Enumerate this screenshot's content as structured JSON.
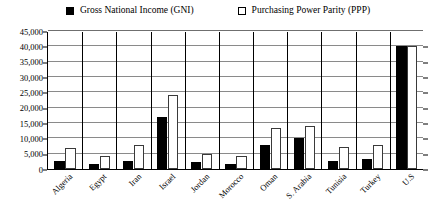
{
  "legend": {
    "position": "top-center",
    "entries": [
      {
        "label": "Gross National Income (GNI)",
        "marker": "filled-square",
        "color": "#000000"
      },
      {
        "label": "Purchasing Power Parity (PPP)",
        "marker": "hollow-square",
        "color": "#ffffff"
      }
    ]
  },
  "chart_data": {
    "type": "bar",
    "title": "",
    "subtitle": "",
    "xlabel": "",
    "ylabel": "",
    "ylim": [
      0,
      45000
    ],
    "ytick_step": 5000,
    "ytick_labels": [
      "0",
      "5,000",
      "10,000",
      "15,000",
      "20,000",
      "25,000",
      "30,000",
      "35,000",
      "40,000",
      "45,000"
    ],
    "ytick_values": [
      0,
      5000,
      10000,
      15000,
      20000,
      25000,
      30000,
      35000,
      40000,
      45000
    ],
    "grid": true,
    "grid_axis": "y",
    "legend_position": "top-center",
    "categories": [
      "Algeria",
      "Egypt",
      "Iran",
      "Israel",
      "Jordan",
      "Morocco",
      "Oman",
      "S. Arabia",
      "Tunisia",
      "Turkey",
      "U.S"
    ],
    "series": [
      {
        "name": "Gross National Income (GNI)",
        "color": "#000000",
        "values": [
          2500,
          1700,
          2600,
          17000,
          2200,
          1700,
          7800,
          10000,
          2700,
          3400,
          40000
        ]
      },
      {
        "name": "Purchasing Power Parity (PPP)",
        "color": "#ffffff",
        "values": [
          7000,
          4400,
          7800,
          24000,
          4800,
          4300,
          13300,
          14000,
          7300,
          7800,
          40000
        ]
      }
    ]
  }
}
